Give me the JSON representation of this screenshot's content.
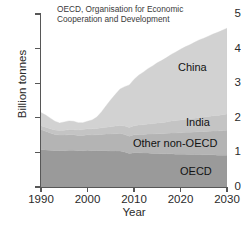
{
  "chart_data": {
    "type": "area",
    "stacked": true,
    "title": "",
    "xlabel": "Year",
    "ylabel": "Billion tonnes",
    "xlim": [
      1990,
      2030
    ],
    "ylim": [
      0,
      5
    ],
    "xticks": [
      1990,
      2000,
      2010,
      2020,
      2030
    ],
    "yticks": [
      0,
      1,
      2,
      3,
      4,
      5
    ],
    "grid": false,
    "legend_position": "in-plot-labels",
    "annotation": "OECD, Organisation for Economic Cooperation and Development",
    "annotation_lines": [
      "OECD,  Organisation for Economic",
      "Cooperation and Development"
    ],
    "x": [
      1990,
      1991,
      1992,
      1993,
      1994,
      1995,
      1996,
      1997,
      1998,
      1999,
      2000,
      2001,
      2002,
      2003,
      2004,
      2005,
      2006,
      2007,
      2008,
      2009,
      2010,
      2011,
      2012,
      2013,
      2014,
      2015,
      2016,
      2017,
      2018,
      2019,
      2020,
      2021,
      2022,
      2023,
      2024,
      2025,
      2026,
      2027,
      2028,
      2029,
      2030
    ],
    "series": [
      {
        "name": "OECD",
        "color": "#9a9a9a",
        "values": [
          1.08,
          1.07,
          1.06,
          1.05,
          1.05,
          1.05,
          1.06,
          1.06,
          1.05,
          1.05,
          1.06,
          1.05,
          1.05,
          1.05,
          1.05,
          1.04,
          1.04,
          1.04,
          1.01,
          0.97,
          0.99,
          0.99,
          0.98,
          0.98,
          0.97,
          0.97,
          0.96,
          0.96,
          0.96,
          0.95,
          0.95,
          0.95,
          0.94,
          0.94,
          0.94,
          0.93,
          0.93,
          0.93,
          0.92,
          0.92,
          0.92
        ]
      },
      {
        "name": "Other non-OECD",
        "color": "#b4b4b4",
        "values": [
          0.58,
          0.54,
          0.5,
          0.47,
          0.45,
          0.45,
          0.45,
          0.45,
          0.44,
          0.44,
          0.45,
          0.45,
          0.46,
          0.47,
          0.48,
          0.49,
          0.5,
          0.51,
          0.51,
          0.5,
          0.52,
          0.53,
          0.54,
          0.55,
          0.56,
          0.57,
          0.58,
          0.59,
          0.6,
          0.61,
          0.62,
          0.63,
          0.64,
          0.65,
          0.66,
          0.67,
          0.68,
          0.69,
          0.7,
          0.71,
          0.72
        ]
      },
      {
        "name": "India",
        "color": "#c4c4c4",
        "values": [
          0.11,
          0.12,
          0.12,
          0.13,
          0.13,
          0.14,
          0.15,
          0.15,
          0.16,
          0.17,
          0.17,
          0.18,
          0.18,
          0.19,
          0.2,
          0.21,
          0.22,
          0.23,
          0.24,
          0.25,
          0.26,
          0.27,
          0.28,
          0.29,
          0.3,
          0.31,
          0.32,
          0.33,
          0.35,
          0.36,
          0.37,
          0.38,
          0.39,
          0.4,
          0.41,
          0.42,
          0.43,
          0.44,
          0.45,
          0.46,
          0.47
        ]
      },
      {
        "name": "China",
        "color": "#d2d2d2",
        "values": [
          0.38,
          0.35,
          0.31,
          0.25,
          0.22,
          0.24,
          0.25,
          0.24,
          0.21,
          0.2,
          0.22,
          0.26,
          0.33,
          0.46,
          0.62,
          0.78,
          0.92,
          1.05,
          1.14,
          1.23,
          1.34,
          1.44,
          1.52,
          1.6,
          1.67,
          1.74,
          1.8,
          1.86,
          1.92,
          1.98,
          2.04,
          2.09,
          2.14,
          2.19,
          2.24,
          2.28,
          2.32,
          2.36,
          2.4,
          2.44,
          2.48
        ]
      }
    ],
    "totals_note": {
      "1990": 2.15,
      "1995": 1.88,
      "2010": 3.11,
      "2030": 4.59
    },
    "series_labels": [
      {
        "name": "China",
        "text": "China"
      },
      {
        "name": "India",
        "text": "India"
      },
      {
        "name": "Other non-OECD",
        "text": "Other non-OECD"
      },
      {
        "name": "OECD",
        "text": "OECD"
      }
    ],
    "colors": {
      "axis": "#575757",
      "text": "#2a2a2a",
      "background": "#ffffff"
    }
  }
}
